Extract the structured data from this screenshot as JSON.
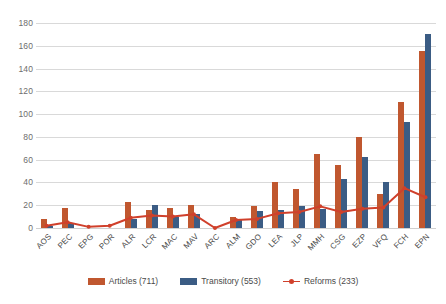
{
  "chart_data": {
    "type": "bar",
    "title": "",
    "xlabel": "",
    "ylabel": "",
    "ylim": [
      0,
      180
    ],
    "yticks": [
      0,
      20,
      40,
      60,
      80,
      100,
      120,
      140,
      160,
      180
    ],
    "grid": true,
    "legend_position": "bottom",
    "categories": [
      "AOS",
      "PEC",
      "EPG",
      "POR",
      "ALR",
      "LCR",
      "MAC",
      "MAV",
      "ARC",
      "ALM",
      "GDO",
      "LEA",
      "JLP",
      "MMH",
      "CSG",
      "EZP",
      "VFQ",
      "FCH",
      "EPN"
    ],
    "series": [
      {
        "name": "Articles (711)",
        "type": "bar",
        "color": "#C0572F",
        "values": [
          8,
          18,
          0,
          0,
          23,
          16,
          18,
          20,
          0,
          10,
          19,
          40,
          34,
          65,
          55,
          80,
          30,
          111,
          155
        ]
      },
      {
        "name": "Transitory (553)",
        "type": "bar",
        "color": "#3B5C84",
        "values": [
          2,
          4,
          0,
          0,
          8,
          20,
          10,
          12,
          0,
          7,
          15,
          16,
          19,
          17,
          43,
          62,
          40,
          93,
          170
        ]
      },
      {
        "name": "Reforms (233)",
        "type": "line",
        "color": "#D0402B",
        "values": [
          2,
          5,
          1,
          2,
          9,
          11,
          10,
          12,
          0,
          7,
          8,
          13,
          14,
          19,
          14,
          17,
          18,
          35,
          27
        ]
      }
    ]
  },
  "legend": {
    "items": [
      {
        "label": "Articles (711)",
        "marker": "bar-swatch-orange"
      },
      {
        "label": "Transitory (553)",
        "marker": "bar-swatch-blue"
      },
      {
        "label": "Reforms (233)",
        "marker": "line-marker-red"
      }
    ]
  },
  "colors": {
    "articles": "#C0572F",
    "transitory": "#3B5C84",
    "reforms": "#D0402B",
    "grid": "#d9d9d9",
    "axis_text": "#6d6d6d",
    "background": "#ffffff"
  }
}
